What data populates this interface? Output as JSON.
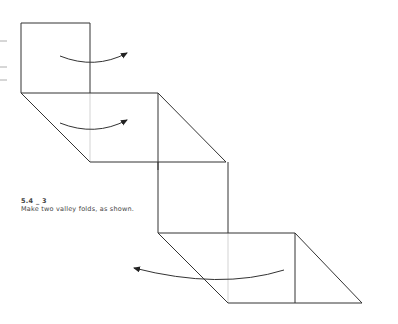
{
  "diagram": {
    "step_number": "5.4 _ 3",
    "instruction": "Make two valley folds, as shown.",
    "colors": {
      "line": "#333333",
      "faint_line": "#bbbbbb",
      "text": "#444444"
    },
    "margin_marks_y": [
      41,
      67,
      80
    ],
    "arrows": [
      {
        "name": "fold-arrow-top",
        "direction": "right"
      },
      {
        "name": "fold-arrow-middle",
        "direction": "right"
      },
      {
        "name": "fold-arrow-bottom",
        "direction": "left"
      }
    ]
  }
}
